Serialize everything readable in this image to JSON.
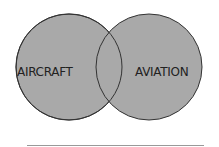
{
  "diagram": {
    "type": "venn",
    "sets": [
      {
        "label": "AIRCRAFT"
      },
      {
        "label": "AVIATION"
      }
    ],
    "fill_color": "#a9a9a9",
    "stroke_color": "#333333"
  }
}
